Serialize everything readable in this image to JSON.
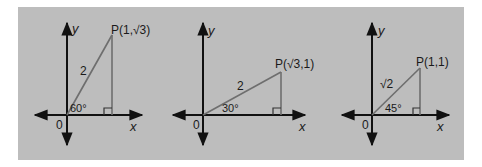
{
  "figure": {
    "background_color": "#bdbdbd",
    "axis_color": "#111111",
    "triangle_color": "#6e6e6e",
    "panels": [
      {
        "id": "panel-60",
        "point_label": "P(1,√3)",
        "point_name": "P",
        "point_coords": "(1,√3)",
        "hypotenuse_label": "2",
        "angle_label": "60°",
        "angle_deg": 60,
        "x_axis_label": "x",
        "y_axis_label": "y",
        "origin_label": "0"
      },
      {
        "id": "panel-30",
        "point_label": "P(√3,1)",
        "point_name": "P",
        "point_coords": "(√3,1)",
        "hypotenuse_label": "2",
        "angle_label": "30°",
        "angle_deg": 30,
        "x_axis_label": "x",
        "y_axis_label": "y",
        "origin_label": "0"
      },
      {
        "id": "panel-45",
        "point_label": "P(1,1)",
        "point_name": "P",
        "point_coords": "(1,1)",
        "hypotenuse_label": "√2",
        "angle_label": "45°",
        "angle_deg": 45,
        "x_axis_label": "x",
        "y_axis_label": "y",
        "origin_label": "0"
      }
    ]
  }
}
